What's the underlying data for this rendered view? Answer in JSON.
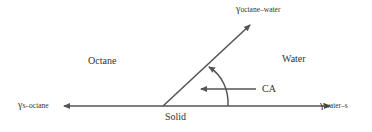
{
  "diagram": {
    "type": "contact-angle",
    "phases": {
      "left": "Octane",
      "right": "Water",
      "bottom": "Solid"
    },
    "vectors": {
      "octane_water": {
        "symbol": "γ",
        "sub": "octane–water"
      },
      "solid_octane": {
        "symbol": "γ",
        "sub": "s–octane"
      },
      "water_solid": {
        "symbol": "γ",
        "sub": "water–s"
      }
    },
    "angle_label": "CA",
    "colors": {
      "line": "#555555",
      "text": "#333333"
    }
  }
}
